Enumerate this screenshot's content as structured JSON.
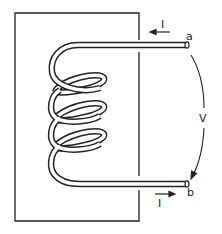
{
  "diagram": {
    "labels": {
      "terminal_a": "a",
      "terminal_b": "b",
      "current_top": "I",
      "current_bottom": "I",
      "voltage": "V"
    },
    "colors": {
      "stroke": "#222222",
      "background": "#ffffff"
    },
    "turns": 4
  }
}
